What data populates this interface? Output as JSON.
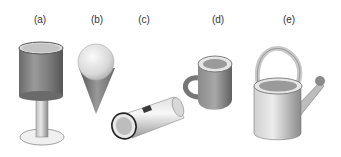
{
  "figure": {
    "labels": {
      "a": "(a)",
      "b": "(b)",
      "c": "(c)",
      "d": "(d)",
      "e": "(e)"
    },
    "objects": {
      "a": "goblet-cylinder-on-stem",
      "b": "cone-with-sphere",
      "c": "flashlight",
      "d": "mug",
      "e": "watering-can"
    }
  }
}
